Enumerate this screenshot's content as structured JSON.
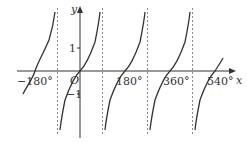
{
  "diagram": {
    "type": "function-graph",
    "function": "y = tan x",
    "axes": {
      "x_label": "x",
      "y_label": "y",
      "origin_label": "O",
      "x_ticks": [
        {
          "value": -180,
          "label": "−180°"
        },
        {
          "value": 180,
          "label": "180°"
        },
        {
          "value": 360,
          "label": "360°"
        },
        {
          "value": 540,
          "label": "540°"
        }
      ],
      "y_ticks": [
        {
          "value": 1,
          "label": "1"
        },
        {
          "value": -1,
          "label": "−1"
        }
      ]
    },
    "asymptotes_deg": [
      -90,
      90,
      270,
      450
    ],
    "zeros_deg": [
      -180,
      0,
      180,
      360,
      540
    ],
    "colors": {
      "curve": "#333333",
      "axis": "#333333",
      "asymptote": "#888888"
    }
  }
}
